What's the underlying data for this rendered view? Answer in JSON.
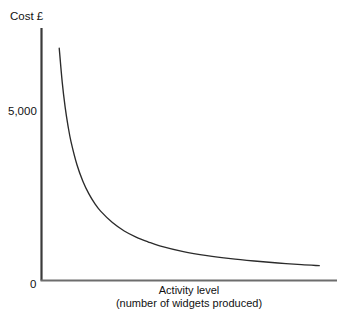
{
  "chart": {
    "y_axis_title": "Cost £",
    "y_tick_label": "5,000",
    "origin_label": "0",
    "x_axis_title_line1": "Activity level",
    "x_axis_title_line2": "(number of widgets produced)"
  },
  "chart_data": {
    "type": "line",
    "title": "",
    "subtitle": "",
    "xlabel": "Activity level (number of widgets produced)",
    "ylabel": "Cost £",
    "grid": false,
    "legend": "none",
    "axis_color": "#3a3a3a",
    "series_color": "#2b2b2b",
    "background_color": "#ffffff",
    "xlim": [
      0,
      100
    ],
    "ylim": [
      0,
      7500
    ],
    "yticks": [
      0,
      5000
    ],
    "ytick_labels": [
      "0",
      "5,000"
    ],
    "xticks": [
      0
    ],
    "xtick_labels": [
      "0"
    ],
    "annotations": [],
    "series": [
      {
        "name": "Fixed cost per unit",
        "description": "Hyperbolic decay: cost per unit falls as activity level rises",
        "x": [
          6,
          7,
          8,
          9,
          10,
          12,
          14,
          16,
          18,
          20,
          24,
          28,
          32,
          36,
          40,
          48,
          56,
          64,
          72,
          80,
          88,
          94
        ],
        "y": [
          6900,
          5900,
          5150,
          4580,
          4120,
          3440,
          2950,
          2580,
          2290,
          2060,
          1720,
          1470,
          1290,
          1150,
          1030,
          860,
          740,
          650,
          580,
          520,
          470,
          440
        ]
      }
    ]
  }
}
